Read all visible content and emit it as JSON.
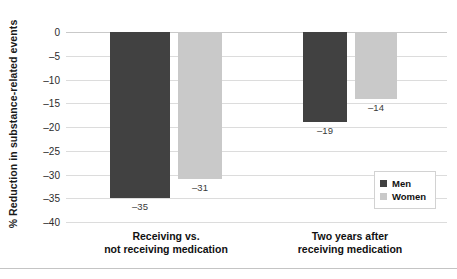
{
  "chart_data": {
    "type": "bar",
    "title": "",
    "subtitle": "",
    "xlabel": "",
    "ylabel": "% Reduction in substance-related events",
    "categories": [
      "Receiving vs.\nnot receiving medication",
      "Two years after\nreceiving medication"
    ],
    "category_lines": [
      [
        "Receiving vs.",
        "not receiving medication"
      ],
      [
        "Two years after",
        "receiving medication"
      ]
    ],
    "series": [
      {
        "name": "Men",
        "values": [
          -35,
          -19
        ],
        "color": "#414141"
      },
      {
        "name": "Women",
        "values": [
          -31,
          -14
        ],
        "color": "#c9c9c9"
      }
    ],
    "bar_labels": [
      {
        "text": "–35"
      },
      {
        "text": "–31"
      },
      {
        "text": "–19"
      },
      {
        "text": "–14"
      }
    ],
    "ylim": [
      -40,
      0
    ],
    "ytick_values": [
      0,
      -5,
      -10,
      -15,
      -20,
      -25,
      -30,
      -35,
      -40
    ],
    "ytick_labels": [
      "0",
      "–5",
      "–10",
      "–15",
      "–20",
      "–25",
      "–30",
      "–35",
      "–40"
    ],
    "grid": "horizontal",
    "legend_position": "right-inside-lower"
  },
  "legend": {
    "items": [
      {
        "label": "Men",
        "color": "#414141"
      },
      {
        "label": "Women",
        "color": "#c9c9c9"
      }
    ]
  }
}
